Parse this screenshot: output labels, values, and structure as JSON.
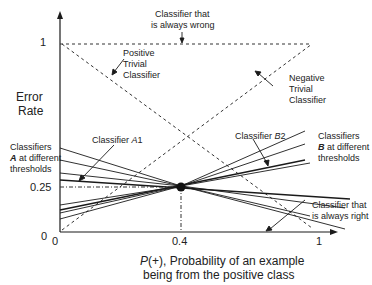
{
  "figure": {
    "y_axis_label_line1": "Error",
    "y_axis_label_line2": "Rate",
    "x_axis_label_line1": "P(+), Probability of an example",
    "x_axis_label_line1_italic": "P",
    "x_axis_label_line1_rest": "(+), Probability of an example",
    "x_axis_label_line2": "being from the positive class",
    "y_ticks": [
      "1",
      "0.25",
      "0"
    ],
    "x_ticks": [
      "0",
      "0.4",
      "1"
    ],
    "annotations": {
      "always_wrong_1": "Classifier that",
      "always_wrong_2": "is always wrong",
      "positive_trivial_1": "Positive",
      "positive_trivial_2": "Trivial",
      "positive_trivial_3": "Classifier",
      "negative_trivial_1": "Negative",
      "negative_trivial_2": "Trivial",
      "negative_trivial_3": "Classifier",
      "classifier_a1": "Classifier A1",
      "classifier_a1_prefix": "Classifier ",
      "classifier_a1_italic": "A",
      "classifier_a1_sub": "1",
      "classifier_b2_prefix": "Classifier ",
      "classifier_b2_italic": "B",
      "classifier_b2_sub": "2",
      "classifiers_a_1": "Classifiers",
      "classifiers_a_bold": "A",
      "classifiers_a_2": " at different",
      "classifiers_a_3": "thresholds",
      "classifiers_b_1": "Classifiers",
      "classifiers_b_bold": "B",
      "classifiers_b_2": " at different",
      "classifiers_b_3": "thresholds",
      "always_right_1": "Classifier that",
      "always_right_2": "is always right"
    },
    "colors": {
      "line": "#1a1a1a",
      "dashed": "#333333",
      "text": "#222222",
      "background": "#ffffff"
    }
  }
}
